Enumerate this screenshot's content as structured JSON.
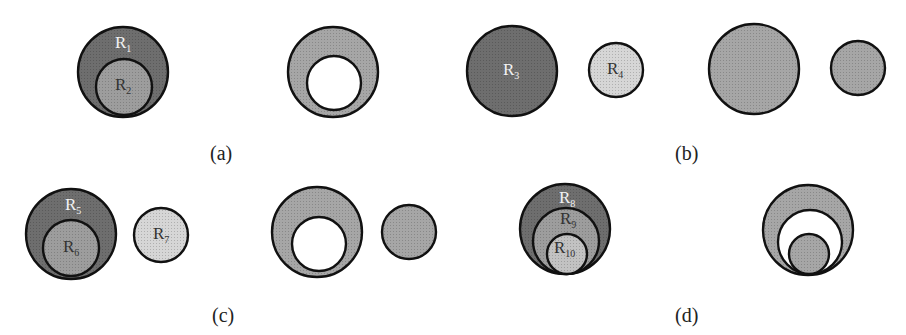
{
  "colors": {
    "dark": "#6e6e6e",
    "medium": "#9d9d9d",
    "light": "#d6d6d6",
    "result": "#a6a6a6",
    "hole": "#ffffff",
    "stroke": "#111111",
    "label_on_dark": "#f2f2f2",
    "label_on_light": "#333333"
  },
  "panels": [
    {
      "id": "a",
      "caption": "(a)",
      "before": [
        {
          "region": "R1",
          "base": "R",
          "sub": "1"
        },
        {
          "region": "R2",
          "base": "R",
          "sub": "2"
        }
      ],
      "description": "R2 nested inside R1; result: R1 with hole where R2 was"
    },
    {
      "id": "b",
      "caption": "(b)",
      "before": [
        {
          "region": "R3",
          "base": "R",
          "sub": "3"
        },
        {
          "region": "R4",
          "base": "R",
          "sub": "4"
        }
      ],
      "description": "R3 and R4 disjoint; result: two disjoint regions"
    },
    {
      "id": "c",
      "caption": "(c)",
      "before": [
        {
          "region": "R5",
          "base": "R",
          "sub": "5"
        },
        {
          "region": "R6",
          "base": "R",
          "sub": "6"
        },
        {
          "region": "R7",
          "base": "R",
          "sub": "7"
        }
      ],
      "description": "R6 nested inside R5, R7 disjoint; result: R5 with hole plus separate R7"
    },
    {
      "id": "d",
      "caption": "(d)",
      "before": [
        {
          "region": "R8",
          "base": "R",
          "sub": "8"
        },
        {
          "region": "R9",
          "base": "R",
          "sub": "9"
        },
        {
          "region": "R10",
          "base": "R",
          "sub": "10"
        }
      ],
      "description": "R10 inside R9 inside R8; result: ring, hole, island"
    }
  ]
}
